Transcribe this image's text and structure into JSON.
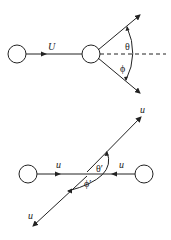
{
  "upper": {
    "incoming_label": "U",
    "angle_top_label": "θ",
    "angle_bottom_label": "ϕ"
  },
  "lower": {
    "left_label": "u",
    "right_label": "u",
    "top_out_label": "u",
    "bottom_out_label": "u",
    "angle_top_label": "θ′",
    "angle_bottom_label": "ϕ′"
  },
  "colors": {
    "stroke": "#222222"
  }
}
